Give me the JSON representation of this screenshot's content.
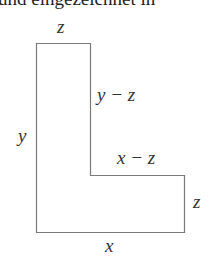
{
  "caption_clipped": "und eingezeichnet in",
  "figure": {
    "shape": "L-shape",
    "stroke_color": "#7a7a7a",
    "vertices": [
      [
        36,
        43
      ],
      [
        90,
        43
      ],
      [
        90,
        175
      ],
      [
        184,
        175
      ],
      [
        184,
        232
      ],
      [
        36,
        232
      ]
    ],
    "labels": {
      "top": "z",
      "left": "y",
      "inner_vertical": "y − z",
      "inner_horizontal": "x − z",
      "right": "z",
      "bottom": "x"
    }
  }
}
